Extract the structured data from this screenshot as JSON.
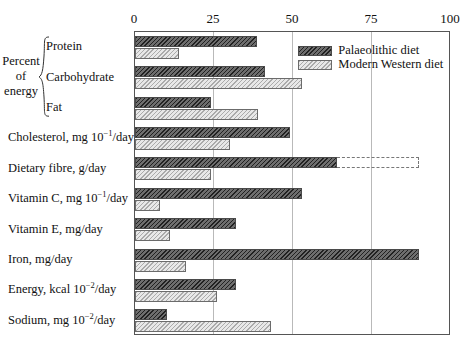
{
  "chart_data": {
    "type": "bar",
    "orientation": "horizontal",
    "title": "",
    "xlabel": "",
    "ylabel": "",
    "xlim": [
      0,
      100
    ],
    "grid": true,
    "xticks": [
      0,
      25,
      50,
      75,
      100
    ],
    "xtick_labels": [
      "0",
      "25",
      "50",
      "75",
      "100"
    ],
    "legend_position": "top-right",
    "legend": [
      {
        "name": "Palaeolithic diet",
        "swatch": "dark-hatched"
      },
      {
        "name": "Modern Western diet",
        "swatch": "light-hatched"
      }
    ],
    "group_label": {
      "line1": "Percent",
      "line2": "of",
      "line3": "energy"
    },
    "categories": [
      "Protein",
      "Carbohydrate",
      "Fat",
      "Cholesterol, mg 10-1/day",
      "Dietary fibre, g/day",
      "Vitamin C, mg 10-1/day",
      "Vitamin E, mg/day",
      "Iron, mg/day",
      "Energy, kcal 10-2/day",
      "Sodium, mg 10-2/day"
    ],
    "series": [
      {
        "name": "Palaeolithic diet",
        "values": [
          38.5,
          41,
          24,
          49,
          64,
          53,
          32,
          90,
          32,
          10
        ]
      },
      {
        "name": "Modern Western diet",
        "values": [
          14,
          53,
          39,
          30,
          24,
          8,
          11,
          16,
          26,
          43
        ]
      }
    ],
    "annotations": [
      {
        "category": "Dietary fibre, g/day",
        "series": "Palaeolithic diet",
        "type": "dashed-extension",
        "from": 64,
        "to": 90
      }
    ],
    "colors": {
      "palaeolithic_fill": "#6e6e6e",
      "modern_fill": "#e8e8e8",
      "frame": "#555555",
      "gridline": "#b9b9b9",
      "text": "#111111"
    }
  },
  "rows": [
    {
      "label": "Protein",
      "label_main": "Protein",
      "label_unit": "",
      "sup": ""
    },
    {
      "label": "Carbohydrate",
      "label_main": "Carbohydrate",
      "label_unit": "",
      "sup": ""
    },
    {
      "label": "Fat",
      "label_main": "Fat",
      "label_unit": "",
      "sup": ""
    },
    {
      "label": "Cholesterol, mg 10-1/day",
      "label_main": "Cholesterol, mg 10",
      "label_unit": "/day",
      "sup": "−1"
    },
    {
      "label": "Dietary fibre, g/day",
      "label_main": "Dietary fibre, g/day",
      "label_unit": "",
      "sup": ""
    },
    {
      "label": "Vitamin C, mg 10-1/day",
      "label_main": "Vitamin C, mg 10",
      "label_unit": "/day",
      "sup": "−1"
    },
    {
      "label": "Vitamin E, mg/day",
      "label_main": "Vitamin E, mg/day",
      "label_unit": "",
      "sup": ""
    },
    {
      "label": "Iron, mg/day",
      "label_main": "Iron, mg/day",
      "label_unit": "",
      "sup": ""
    },
    {
      "label": "Energy, kcal 10-2/day",
      "label_main": "Energy, kcal 10",
      "label_unit": "/day",
      "sup": "−2"
    },
    {
      "label": "Sodium, mg 10-2/day",
      "label_main": "Sodium, mg 10",
      "label_unit": "/day",
      "sup": "−2"
    }
  ]
}
